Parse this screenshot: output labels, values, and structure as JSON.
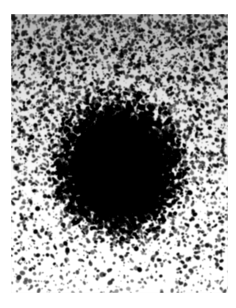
{
  "figure": {
    "kind": "grainy-photographic-plate",
    "description": "Coarse-grained black-and-white photographic plate showing a dense dark roughly circular concentration near the center surrounded by scattered speckle grain",
    "canvas_width": 236,
    "canvas_height": 308,
    "page_background": "#ffffff"
  },
  "plate": {
    "left": 11,
    "top": 14,
    "width": 217,
    "height": 279,
    "base_tone_top": "#a8a8a8",
    "base_tone_bottom": "#f4f4f4",
    "grain_color": "#0d0d0d",
    "border_color": "#ffffff"
  },
  "blob": {
    "label": "central-dark-concentration",
    "center_x": 119,
    "center_y": 166,
    "core_radius_x": 38,
    "core_radius_y": 42,
    "halo_radius_x": 62,
    "halo_radius_y": 66,
    "core_color": "#000000"
  },
  "grain_field": {
    "density_top": 0.52,
    "density_bottom": 0.14,
    "grain_min_size": 1,
    "grain_max_size": 5,
    "seed": 20240517
  },
  "margins": {
    "top": 14,
    "left": 11,
    "right": 8,
    "bottom": 15
  }
}
